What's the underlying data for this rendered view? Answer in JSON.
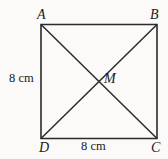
{
  "figure": {
    "type": "geometry-diagram",
    "shape": "square-with-diagonals",
    "canvas": {
      "width": 168,
      "height": 159
    },
    "background_color": "#fbfaf8",
    "stroke_color": "#2b2b2b",
    "stroke_width": 1.6,
    "text_color": "#1a1a1a",
    "square": {
      "top_left": {
        "x": 41,
        "y": 24.5
      },
      "top_right": {
        "x": 157,
        "y": 24.5
      },
      "bottom_right": {
        "x": 157,
        "y": 138.5
      },
      "bottom_left": {
        "x": 41,
        "y": 138.5
      }
    },
    "diagonals": [
      {
        "name": "diagonal-a-c",
        "from": {
          "x": 41,
          "y": 24.5
        },
        "to": {
          "x": 157,
          "y": 138.5
        }
      },
      {
        "name": "diagonal-b-d",
        "from": {
          "x": 157,
          "y": 24.5
        },
        "to": {
          "x": 41,
          "y": 138.5
        }
      }
    ],
    "intersection": {
      "x": 99,
      "y": 81.5
    },
    "vertices": {
      "top_left": "A",
      "top_right": "B",
      "bottom_right": "C",
      "bottom_left": "D"
    },
    "center_point": "M",
    "dimensions": {
      "left_side": "8 cm",
      "bottom_side": "8 cm"
    }
  }
}
